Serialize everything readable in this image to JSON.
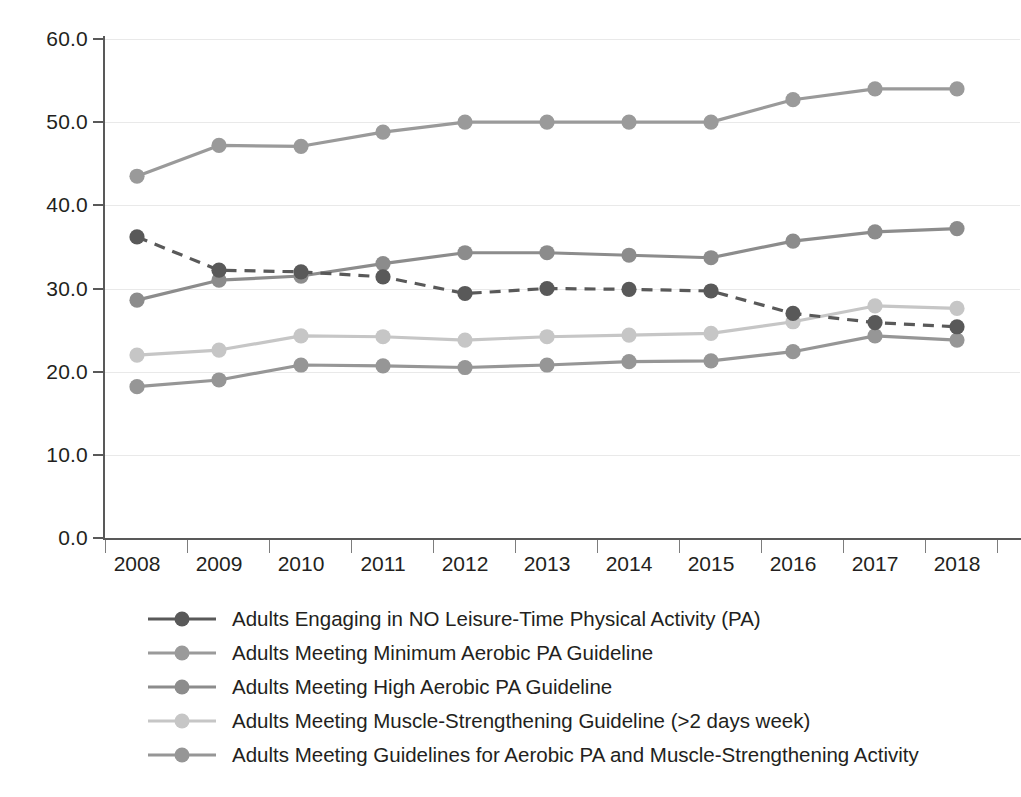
{
  "chart_data": {
    "type": "line",
    "title": "",
    "subtitle": "",
    "xlabel": "",
    "ylabel": "",
    "x": [
      2008,
      2009,
      2010,
      2011,
      2012,
      2013,
      2014,
      2015,
      2016,
      2017,
      2018
    ],
    "categories": [
      "2008",
      "2009",
      "2010",
      "2011",
      "2012",
      "2013",
      "2014",
      "2015",
      "2016",
      "2017",
      "2018"
    ],
    "xtick_labels": [
      "2008",
      "2009",
      "2010",
      "2011",
      "2012",
      "2013",
      "2014",
      "2015",
      "2016",
      "2017",
      "2018"
    ],
    "ytick_labels": [
      "0.0",
      "10.0",
      "20.0",
      "30.0",
      "40.0",
      "50.0",
      "60.0"
    ],
    "ytick_values": [
      0,
      10,
      20,
      30,
      40,
      50,
      60
    ],
    "ylim": [
      0,
      60
    ],
    "xlim": [
      2008,
      2018
    ],
    "grid": true,
    "grid_axis": "y",
    "legend_position": "bottom-left",
    "series": [
      {
        "name": "Adults Engaging in NO Leisure-Time Physical Activity (PA)",
        "color": "#595959",
        "linestyle": "dashed",
        "values": [
          36.2,
          32.2,
          32.0,
          31.4,
          29.4,
          30.0,
          29.9,
          29.7,
          27.0,
          25.9,
          25.4
        ]
      },
      {
        "name": "Adults Meeting Minimum Aerobic PA Guideline",
        "color": "#9a9a9a",
        "linestyle": "solid",
        "values": [
          43.5,
          47.2,
          47.1,
          48.8,
          50.0,
          50.0,
          50.0,
          50.0,
          52.7,
          54.0,
          54.0
        ]
      },
      {
        "name": "Adults Meeting High Aerobic PA Guideline",
        "color": "#8c8c8c",
        "linestyle": "solid",
        "values": [
          28.6,
          31.0,
          31.5,
          33.0,
          34.3,
          34.3,
          34.0,
          33.7,
          35.7,
          36.8,
          37.2
        ]
      },
      {
        "name": "Adults Meeting Muscle-Strengthening Guideline (>2 days week)",
        "color": "#c6c6c6",
        "linestyle": "solid",
        "values": [
          22.0,
          22.6,
          24.3,
          24.2,
          23.8,
          24.2,
          24.4,
          24.6,
          26.0,
          27.9,
          27.6
        ]
      },
      {
        "name": "Adults Meeting Guidelines for Aerobic PA and Muscle-Strengthening Activity",
        "color": "#969696",
        "linestyle": "solid",
        "values": [
          18.2,
          19.0,
          20.8,
          20.7,
          20.5,
          20.8,
          21.2,
          21.3,
          22.4,
          24.3,
          23.8
        ]
      }
    ]
  }
}
